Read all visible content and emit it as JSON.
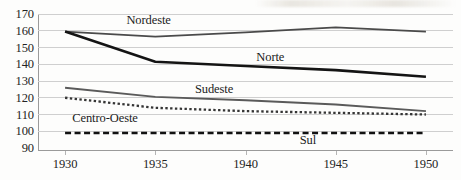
{
  "chart_data": {
    "type": "line",
    "title": "",
    "xlabel": "",
    "ylabel": "",
    "x": [
      1930,
      1935,
      1940,
      1945,
      1950
    ],
    "x_tick_labels": [
      "1930",
      "1935",
      "1940",
      "1945",
      "1950"
    ],
    "xlim": [
      1928.5,
      1951.5
    ],
    "ylim": [
      90,
      170
    ],
    "y_tick_labels": [
      "170",
      "160",
      "150",
      "140",
      "130",
      "120",
      "110",
      "100",
      "90"
    ],
    "y_ticks": [
      170,
      160,
      150,
      140,
      130,
      120,
      110,
      100,
      90
    ],
    "grid": "horizontal",
    "legend": "inline-labels",
    "series": [
      {
        "name": "Nordeste",
        "values": [
          159.5,
          156.5,
          159.0,
          162.0,
          159.5
        ],
        "style": "solid",
        "color": "#4a4a4a",
        "width": 1.9,
        "label_x": 1933.4,
        "label_y": 166.5
      },
      {
        "name": "Norte",
        "values": [
          159.5,
          141.5,
          139.0,
          136.5,
          132.5
        ],
        "style": "solid",
        "color": "#141414",
        "width": 2.6,
        "label_x": 1940.6,
        "label_y": 144.5
      },
      {
        "name": "Sudeste",
        "values": [
          126.0,
          120.5,
          118.5,
          116.0,
          112.0
        ],
        "style": "solid",
        "color": "#5a5a5a",
        "width": 1.9,
        "label_x": 1937.2,
        "label_y": 125.5
      },
      {
        "name": "Centro-Oeste",
        "values": [
          120.0,
          114.0,
          112.0,
          111.0,
          110.0
        ],
        "style": "dotted",
        "color": "#353535",
        "width": 2.3,
        "label_x": 1930.4,
        "label_y": 108.0
      },
      {
        "name": "Sul",
        "values": [
          99.0,
          99.0,
          99.0,
          99.0,
          99.0
        ],
        "style": "dashed",
        "color": "#111111",
        "width": 2.6,
        "label_x": 1943.0,
        "label_y": 94.5
      }
    ]
  }
}
